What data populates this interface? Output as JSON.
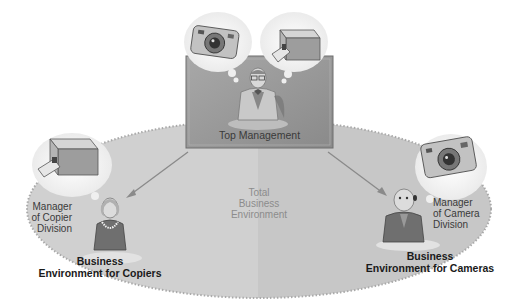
{
  "diagram": {
    "type": "organizational-environment",
    "top_management": {
      "label": "Top Management",
      "thought_items": [
        "camera",
        "copier"
      ]
    },
    "total_environment": {
      "line1": "Total",
      "line2": "Business",
      "line3": "Environment"
    },
    "copier_division": {
      "manager_line1": "Manager",
      "manager_line2": "of Copier",
      "manager_line3": "Division",
      "env_line1": "Business",
      "env_line2": "Environment for Copiers",
      "thought_item": "copier"
    },
    "camera_division": {
      "manager_line1": "Manager",
      "manager_line2": "of Camera",
      "manager_line3": "Division",
      "env_line1": "Business",
      "env_line2": "Environment for Cameras",
      "thought_item": "camera"
    },
    "colors": {
      "ellipse_left": "#cfcfcf",
      "ellipse_right": "#c6c6c6",
      "box_fill": "#9a9a9a",
      "arrow": "#8a8a8a"
    }
  }
}
